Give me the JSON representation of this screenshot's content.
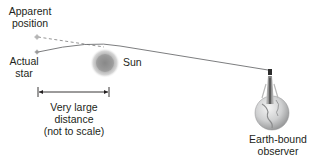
{
  "figure": {
    "type": "diagram"
  },
  "labels": {
    "apparent_position": [
      "Apparent",
      "position"
    ],
    "actual_star": [
      "Actual",
      "star"
    ],
    "sun": "Sun",
    "distance": [
      "Very large",
      "distance",
      "(not to scale)"
    ],
    "observer": [
      "Earth-bound",
      "observer"
    ]
  },
  "colors": {
    "text": "#231f20",
    "light_path": "#6d6e71",
    "dashed_line": "#8a8a8a",
    "sun_core": "#8c8c8c",
    "sun_glow": "#c8c8c8",
    "globe": "#bcbec0"
  },
  "elements": {
    "apparent_star": {
      "x": 37,
      "y": 37
    },
    "actual_star": {
      "x": 37,
      "y": 52
    },
    "sun": {
      "x": 105,
      "y": 63,
      "r": 14
    },
    "dimension_bar": {
      "x1": 38,
      "x2": 109,
      "y": 92
    },
    "observer": {
      "x": 270,
      "y": 70
    },
    "earth": {
      "x": 272,
      "y": 113,
      "r": 17
    }
  }
}
